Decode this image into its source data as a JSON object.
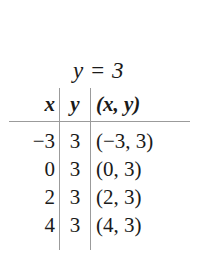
{
  "figure": {
    "equation": "y = 3",
    "table": {
      "headers": [
        "x",
        "y",
        "(x, y)"
      ],
      "rows": [
        {
          "x": "−3",
          "y": "3",
          "pair": "(−3, 3)"
        },
        {
          "x": "0",
          "y": "3",
          "pair": "(0, 3)"
        },
        {
          "x": "2",
          "y": "3",
          "pair": "(2, 3)"
        },
        {
          "x": "4",
          "y": "3",
          "pair": "(4, 3)"
        }
      ]
    },
    "colors": {
      "background": "#ffffff",
      "text": "#1a1a1a",
      "rule": "#9b9b9b"
    }
  }
}
